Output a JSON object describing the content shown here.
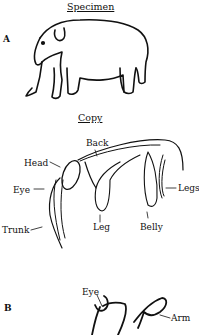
{
  "figure": {
    "panel_a": {
      "letter": "A",
      "specimen_title": "Specimen",
      "copy_title": "Copy",
      "copy_labels": {
        "back": "Back",
        "head": "Head",
        "eye": "Eye",
        "trunk": "Trunk",
        "leg": "Leg",
        "belly": "Belly",
        "legs": "Legs"
      }
    },
    "panel_b": {
      "letter": "B",
      "labels": {
        "eye": "Eye",
        "arm": "Arm"
      }
    }
  }
}
